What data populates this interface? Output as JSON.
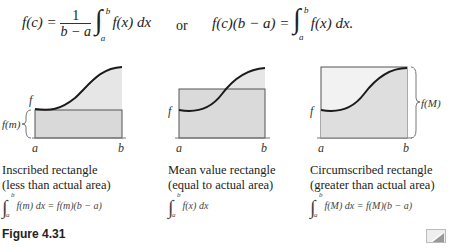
{
  "equations": {
    "mean_value_lhs": "f(c) =",
    "frac_num": "1",
    "frac_den": "b − a",
    "integrand_1": "f(x) dx",
    "or": "or",
    "alt_lhs": "f(c)(b − a) =",
    "integrand_2": "f(x) dx.",
    "upper": "b",
    "lower": "a"
  },
  "panels": [
    {
      "labels": {
        "f": "f",
        "a": "a",
        "b": "b",
        "side": "f(m)"
      },
      "caption_line1": "Inscribed rectangle",
      "caption_line2": "(less than actual area)",
      "formula": "f(m) dx = f(m)(b − a)",
      "upper": "b",
      "lower": "a"
    },
    {
      "labels": {
        "f": "f",
        "a": "a",
        "b": "b"
      },
      "caption_line1": "Mean value rectangle",
      "caption_line2": "(equal to actual area)",
      "formula": "f(x) dx",
      "upper": "b",
      "lower": "a"
    },
    {
      "labels": {
        "f": "f",
        "a": "a",
        "b": "b",
        "side": "f(M)"
      },
      "caption_line1": "Circumscribed rectangle",
      "caption_line2": "(greater than actual area)",
      "formula": "f(M) dx = f(M)(b − a)",
      "upper": "b",
      "lower": "a"
    }
  ],
  "figure_label": "Figure 4.31",
  "colors": {
    "fill": "#e6e6e6",
    "curve": "#1a1a1a",
    "rect": "#555555"
  }
}
